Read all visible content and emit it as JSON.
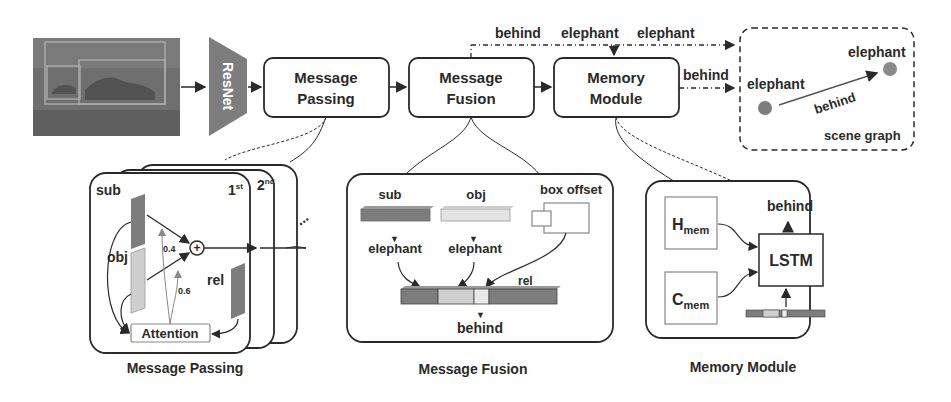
{
  "pipeline": {
    "input_image": "elephant-photo-with-bounding-boxes",
    "backbone_label": "ResNet",
    "stages": [
      {
        "line1": "Message",
        "line2": "Passing"
      },
      {
        "line1": "Message",
        "line2": "Fusion"
      },
      {
        "line1": "Memory",
        "line2": "Module"
      }
    ],
    "top_labels": [
      "behind",
      "elephant",
      "elephant"
    ],
    "memory_output_label": "behind"
  },
  "scene_graph": {
    "title": "scene graph",
    "subject": "elephant",
    "object": "elephant",
    "relation": "behind"
  },
  "message_passing": {
    "caption": "Message Passing",
    "sub_label": "sub",
    "obj_label": "obj",
    "rel_label": "rel",
    "attention_label": "Attention",
    "weight_a": "0.4",
    "weight_b": "0.6",
    "layer1": "1",
    "layer1_sup": "st",
    "layer2": "2",
    "layer2_sup": "nd",
    "ellipsis": "..."
  },
  "message_fusion": {
    "caption": "Message Fusion",
    "sub_label": "sub",
    "obj_label": "obj",
    "box_offset_label": "box offset",
    "sub_class": "elephant",
    "obj_class": "elephant",
    "rel_label": "rel",
    "output": "behind"
  },
  "memory_module": {
    "caption": "Memory Module",
    "h_label": "H",
    "h_sub": "mem",
    "c_label": "C",
    "c_sub": "mem",
    "lstm_label": "LSTM",
    "output": "behind"
  },
  "colors": {
    "dark_gray": "#7d7d7d",
    "light_gray": "#cfcfcf",
    "stroke": "#2a2a2a"
  }
}
